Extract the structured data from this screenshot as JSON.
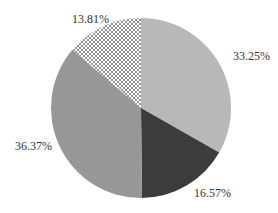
{
  "chart_data": {
    "type": "pie",
    "title": "",
    "start_angle_deg": 90,
    "direction": "clockwise",
    "slices": [
      {
        "label": "33.25%",
        "value": 33.25,
        "color": "#b8b8b8",
        "pattern": "solid"
      },
      {
        "label": "16.57%",
        "value": 16.57,
        "color": "#3c3c3c",
        "pattern": "solid"
      },
      {
        "label": "36.37%",
        "value": 36.37,
        "color": "#979797",
        "pattern": "solid"
      },
      {
        "label": "13.81%",
        "value": 13.81,
        "color": "#ffffff",
        "pattern": "crosshatch"
      }
    ],
    "legend": "none"
  },
  "labels": {
    "s0": "33.25%",
    "s1": "16.57%",
    "s2": "36.37%",
    "s3": "13.81%"
  }
}
